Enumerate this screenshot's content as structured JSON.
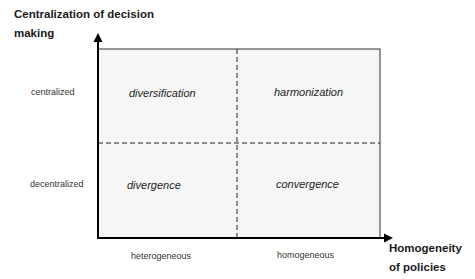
{
  "diagram": {
    "y_axis": {
      "title_line1": "Centralization of decision",
      "title_line2": "making",
      "ticks": [
        "centralized",
        "decentralized"
      ]
    },
    "x_axis": {
      "title_line1": "Homogeneity",
      "title_line2": "of policies",
      "ticks": [
        "heterogeneous",
        "homogeneous"
      ]
    },
    "quadrants": {
      "top_left": "diversification",
      "top_right": "harmonization",
      "bottom_left": "divergence",
      "bottom_right": "convergence"
    },
    "colors": {
      "box_fill": "#f7f7f7",
      "line": "#111111",
      "text": "#222222"
    }
  }
}
